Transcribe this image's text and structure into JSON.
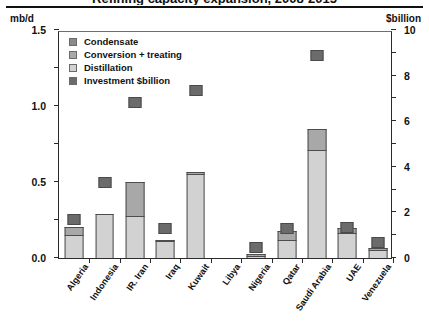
{
  "header": {
    "title_clipped": "Refining capacity expansion, 2008-2015",
    "left_axis_unit": "mb/d",
    "right_axis_unit": "$billion"
  },
  "legend": {
    "position": "top-left-inside",
    "items": [
      {
        "label": "Condensate",
        "color": "#8a8a8a",
        "swatch_name": "legend-swatch-condensate"
      },
      {
        "label": "Conversion + treating",
        "color": "#a8a8a8",
        "swatch_name": "legend-swatch-conversion"
      },
      {
        "label": "Distillation",
        "color": "#d2d2d2",
        "swatch_name": "legend-swatch-distillation"
      },
      {
        "label": "Investment $billion",
        "color": "#6b6b6b",
        "swatch_name": "legend-swatch-investment"
      }
    ]
  },
  "chart_data": {
    "type": "bar",
    "title": "Refining capacity expansion, 2008-2015",
    "xlabel": "",
    "ylabel": "mb/d",
    "ylabel_right": "$billion",
    "ylim": [
      0,
      3.0
    ],
    "ylim_right": [
      0,
      20
    ],
    "yticks": [
      "0.0",
      "0.5",
      "1.0",
      "1.5",
      "2.0",
      "2.5",
      "3.0"
    ],
    "yticks_right": [
      "0",
      "2",
      "4",
      "6",
      "8",
      "10",
      "12",
      "14",
      "16",
      "18",
      "20"
    ],
    "grid": false,
    "stacked": true,
    "categories": [
      "Algeria",
      "Indonesia",
      "IR. Iran",
      "Iraq",
      "Kuwait",
      "Libya",
      "Nigeria",
      "Qatar",
      "Saudi Arabia",
      "UAE",
      "Venezuela"
    ],
    "series": [
      {
        "name": "Distillation",
        "unit": "mb/d",
        "color": "#d2d2d2",
        "values": [
          0.3,
          0.58,
          0.55,
          0.22,
          1.1,
          0.0,
          0.03,
          0.24,
          1.42,
          0.33,
          0.11
        ]
      },
      {
        "name": "Conversion + treating",
        "unit": "mb/d",
        "color": "#a8a8a8",
        "values": [
          0.11,
          0.0,
          0.45,
          0.02,
          0.03,
          0.0,
          0.01,
          0.12,
          0.28,
          0.07,
          0.02
        ]
      },
      {
        "name": "Condensate",
        "unit": "mb/d",
        "color": "#8a8a8a",
        "values": [
          0.0,
          0.0,
          0.0,
          0.0,
          0.0,
          0.0,
          0.0,
          0.0,
          0.0,
          0.0,
          0.0
        ]
      },
      {
        "name": "Investment $billion",
        "unit": "$billion",
        "color": "#6b6b6b",
        "marker": true,
        "values": [
          3.4,
          6.7,
          13.6,
          2.6,
          14.7,
          null,
          0.9,
          2.6,
          17.8,
          3.4,
          1.4
        ],
        "values_mbd_scale": [
          0.51,
          1.0,
          2.04,
          0.39,
          2.2,
          null,
          0.14,
          0.39,
          2.67,
          0.4,
          0.21
        ]
      }
    ]
  }
}
